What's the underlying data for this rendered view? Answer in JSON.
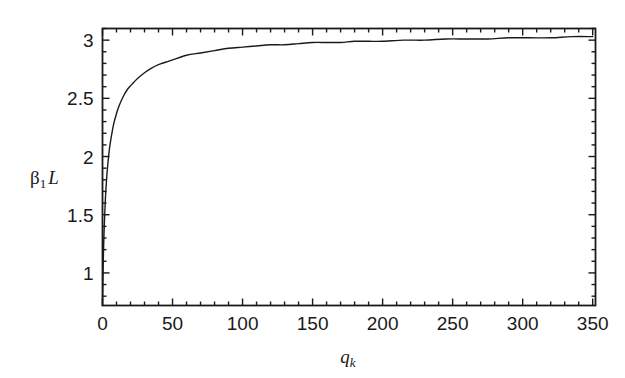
{
  "chart_data": {
    "type": "line",
    "title": "",
    "subtitle": "",
    "xlabel": "q_k",
    "xlabel_base": "q",
    "xlabel_sub": "k",
    "ylabel": "β₁L",
    "ylabel_base": "β",
    "ylabel_sub": "1",
    "ylabel_tail": "L",
    "xlim": [
      0,
      352
    ],
    "ylim": [
      0.72,
      3.1
    ],
    "xticks": [
      0,
      50,
      100,
      150,
      200,
      250,
      300,
      350
    ],
    "xticklabels": [
      "0",
      "50",
      "100",
      "150",
      "200",
      "250",
      "300",
      "350"
    ],
    "x_minor_step": 10,
    "yticks": [
      1,
      1.5,
      2,
      2.5,
      3
    ],
    "yticklabels": [
      "1",
      "1.5",
      "2",
      "2.5",
      "3"
    ],
    "y_minor_step": 0.1,
    "grid": false,
    "legend": null,
    "frame": "box",
    "tick_direction": "in",
    "line_color": "#1a1a1a",
    "line_width": 1.4,
    "axis_color": "#1a1a1a",
    "background": "#ffffff",
    "series": [
      {
        "name": "β₁L vs qₖ",
        "x": [
          0.0,
          0.5,
          1,
          2,
          3,
          4,
          5,
          6,
          8,
          10,
          12,
          15,
          18,
          21,
          25,
          30,
          35,
          40,
          45,
          50,
          60,
          70,
          80,
          90,
          100,
          110,
          120,
          130,
          140,
          150,
          160,
          170,
          180,
          190,
          200,
          215,
          230,
          245,
          260,
          275,
          290,
          305,
          320,
          335,
          350
        ],
        "y": [
          0.72,
          1.07,
          1.31,
          1.62,
          1.82,
          1.96,
          2.07,
          2.15,
          2.28,
          2.37,
          2.44,
          2.52,
          2.58,
          2.62,
          2.67,
          2.72,
          2.76,
          2.79,
          2.81,
          2.83,
          2.87,
          2.89,
          2.91,
          2.93,
          2.94,
          2.95,
          2.96,
          2.96,
          2.97,
          2.98,
          2.98,
          2.98,
          2.99,
          2.99,
          2.99,
          3.0,
          3.0,
          3.01,
          3.01,
          3.01,
          3.02,
          3.02,
          3.02,
          3.03,
          3.03
        ],
        "asymptote": 3.1416,
        "description": "Monotonically increasing saturating curve approaching π"
      }
    ]
  },
  "axis_label_positions": {
    "y_title_x": 30,
    "y_title_y": 168,
    "x_title_x": 348,
    "x_title_y": 347
  }
}
